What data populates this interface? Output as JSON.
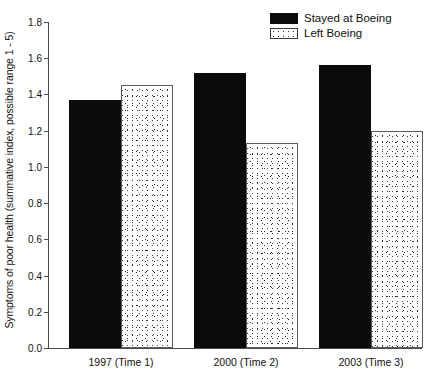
{
  "chart_data": {
    "type": "bar",
    "title": "",
    "xlabel": "",
    "ylabel": "Symptoms of poor health (summative index, possible range 1 - 5)",
    "categories": [
      "1997 (Time 1)",
      "2000 (Time 2)",
      "2003 (Time 3)"
    ],
    "series": [
      {
        "name": "Stayed at Boeing",
        "fill": "solid-black",
        "color": "#0b0b0b",
        "values": [
          1.37,
          1.52,
          1.56
        ]
      },
      {
        "name": "Left Boeing",
        "fill": "stippled-white",
        "color": "#ffffff",
        "values": [
          1.45,
          1.13,
          1.2
        ]
      }
    ],
    "ylim": [
      0.0,
      1.8
    ],
    "ytick_labels": [
      "0.0",
      "0.2",
      "0.4",
      "0.6",
      "0.8",
      "1.0",
      "1.2",
      "1.4",
      "1.6",
      "1.8"
    ],
    "ytick_values": [
      0.0,
      0.2,
      0.4,
      0.6,
      0.8,
      1.0,
      1.2,
      1.4,
      1.6,
      1.8
    ],
    "grid": false,
    "legend_position": "top-right"
  }
}
